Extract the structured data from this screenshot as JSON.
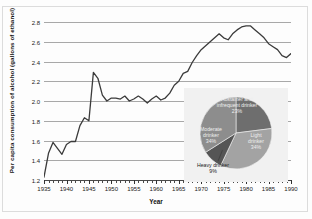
{
  "chart_data": [
    {
      "type": "line",
      "title": "",
      "xlabel": "Year",
      "ylabel": "Per capita consumption of alcohol (gallons of ethanol)",
      "xlim": [
        1935,
        1990
      ],
      "ylim": [
        1.2,
        2.8
      ],
      "ytick_step": 0.2,
      "xtick_step": 1,
      "xtick_label_step": 5,
      "grid": "horizontal",
      "legend": "none",
      "line_color": "#3b3b3b",
      "yticks": [
        "2.8",
        "2.6",
        "2.4",
        "2.2",
        "2.0",
        "1.8",
        "1.6",
        "1.4",
        "1.2"
      ],
      "xticks": [
        "1935",
        "1940",
        "1945",
        "1950",
        "1955",
        "1960",
        "1965",
        "1970",
        "1975",
        "1980",
        "1985",
        "1990"
      ],
      "x": [
        1935,
        1936,
        1937,
        1938,
        1939,
        1940,
        1941,
        1942,
        1943,
        1944,
        1945,
        1946,
        1947,
        1948,
        1949,
        1950,
        1951,
        1952,
        1953,
        1954,
        1955,
        1956,
        1957,
        1958,
        1959,
        1960,
        1961,
        1962,
        1963,
        1964,
        1965,
        1966,
        1967,
        1968,
        1969,
        1970,
        1971,
        1972,
        1973,
        1974,
        1975,
        1976,
        1977,
        1978,
        1979,
        1980,
        1981,
        1982,
        1983,
        1984,
        1985,
        1986,
        1987,
        1988,
        1989,
        1990
      ],
      "values": [
        1.23,
        1.47,
        1.58,
        1.52,
        1.46,
        1.56,
        1.59,
        1.59,
        1.75,
        1.83,
        1.8,
        2.29,
        2.23,
        2.06,
        2.0,
        2.03,
        2.03,
        2.02,
        2.05,
        2.0,
        2.02,
        2.05,
        2.02,
        1.98,
        2.02,
        2.05,
        2.01,
        2.03,
        2.08,
        2.16,
        2.2,
        2.28,
        2.3,
        2.39,
        2.46,
        2.52,
        2.56,
        2.6,
        2.64,
        2.68,
        2.64,
        2.62,
        2.68,
        2.72,
        2.75,
        2.76,
        2.76,
        2.72,
        2.68,
        2.64,
        2.58,
        2.55,
        2.52,
        2.46,
        2.44,
        2.48
      ]
    },
    {
      "type": "pie",
      "title": "",
      "inset": true,
      "categories": [
        "Abstainer and infrequent drinker",
        "Light drinker",
        "Heavy drinker",
        "Moderate drinker"
      ],
      "values": [
        23,
        34,
        9,
        34
      ],
      "labels": [
        "Abstainer and\ninfrequent drinker\n23%",
        "Light\ndrinker\n34%",
        "Heavy drinker\n9%",
        "Moderate\ndrinker\n34%"
      ],
      "slice_colors": [
        "#6e6e6e",
        "#a3a3a3",
        "#555555",
        "#8d8d8d"
      ],
      "background": "#f1f1f1"
    }
  ],
  "axis": {
    "y_title": "Per capita consumption of alcohol (gallons of ethanol)",
    "x_title": "Year"
  },
  "pie": {
    "abstainer_label": "Abstainer and\ninfrequent drinker\n23%",
    "light_label": "Light\ndrinker\n34%",
    "moderate_label": "Moderate\ndrinker\n34%",
    "heavy_label": "Heavy drinker\n9%"
  }
}
